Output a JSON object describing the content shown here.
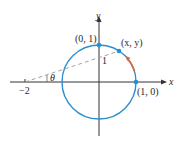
{
  "diagram": {
    "axes": {
      "x_label": "x",
      "y_label": "y"
    },
    "points": {
      "top": "(0, 1)",
      "right": "(1, 0)",
      "moving": "(x, y)"
    },
    "tick_label": "−2",
    "radius_label": "1",
    "angle_label": "θ",
    "colors": {
      "circle": "#2e8fd0",
      "point": "#1e90d8",
      "arrow": "#d9663a",
      "axis": "#333333",
      "dashed": "#9a9a9a"
    }
  }
}
